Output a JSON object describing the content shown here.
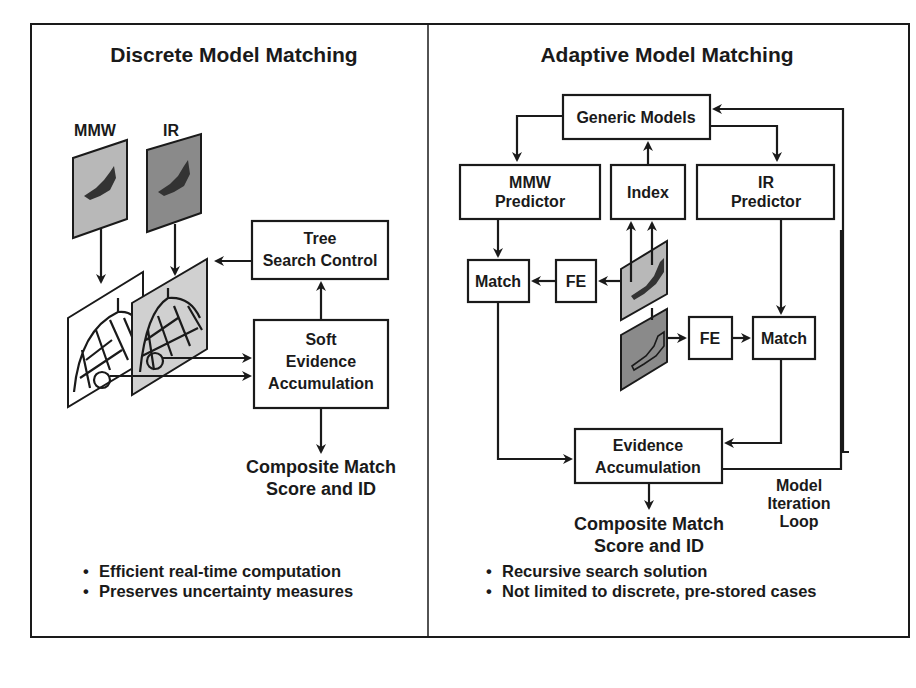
{
  "left_panel": {
    "title": "Discrete Model Matching",
    "sensor_labels": {
      "mmw": "MMW",
      "ir": "IR"
    },
    "tree_search": {
      "line1": "Tree",
      "line2": "Search Control"
    },
    "soft_evidence": {
      "line1": "Soft",
      "line2": "Evidence",
      "line3": "Accumulation"
    },
    "output": {
      "line1": "Composite Match",
      "line2": "Score and ID"
    },
    "bullets": [
      "Efficient real-time computation",
      "Preserves uncertainty measures"
    ]
  },
  "right_panel": {
    "title": "Adaptive Model Matching",
    "generic_models": "Generic Models",
    "mmw_predictor": {
      "line1": "MMW",
      "line2": "Predictor"
    },
    "index": "Index",
    "ir_predictor": {
      "line1": "IR",
      "line2": "Predictor"
    },
    "match_left": "Match",
    "fe_left": "FE",
    "fe_right": "FE",
    "match_right": "Match",
    "evidence": {
      "line1": "Evidence",
      "line2": "Accumulation"
    },
    "loop_label": {
      "line1": "Model",
      "line2": "Iteration",
      "line3": "Loop"
    },
    "output": {
      "line1": "Composite Match",
      "line2": "Score and ID"
    },
    "bullets": [
      "Recursive search solution",
      "Not limited to discrete, pre-stored cases"
    ]
  },
  "colors": {
    "ink": "#1a1a1a",
    "mmw_image_fill": "#b8b8b8",
    "ir_image_fill": "#8a8a8a",
    "grid_image_fill": "#d0d0d0"
  }
}
